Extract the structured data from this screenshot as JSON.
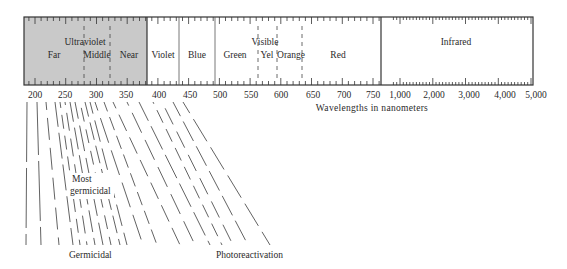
{
  "diagram": {
    "colors": {
      "uv_fill": "#c9c9c9",
      "line": "#333333",
      "background": "#ffffff"
    },
    "bands": {
      "ultraviolet": {
        "label": "Ultraviolet",
        "sub": [
          "Far",
          "Middle",
          "Near"
        ]
      },
      "visible": {
        "label": "Visible",
        "colors": [
          "Violet",
          "Blue",
          "Green",
          "Yel",
          "Orange",
          "Red"
        ]
      },
      "infrared": {
        "label": "Infrared"
      }
    },
    "axis": {
      "ticks": [
        "200",
        "250",
        "300",
        "350",
        "400",
        "450",
        "500",
        "550",
        "600",
        "650",
        "700",
        "750",
        "1,000",
        "2,000",
        "3,000",
        "4,000",
        "5,000"
      ],
      "label": "Wavelengths in nanometers"
    },
    "annotations": {
      "most_germicidal_1": "Most",
      "most_germicidal_2": "germicidal",
      "germicidal": "Germicidal",
      "photoreactivation": "Photoreactivation"
    }
  }
}
